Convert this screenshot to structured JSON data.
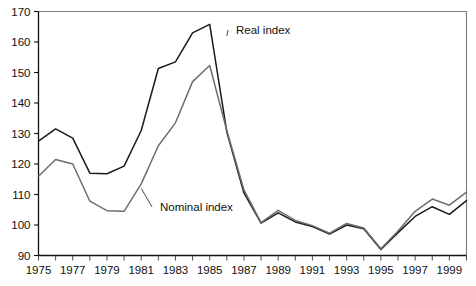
{
  "chart_data": {
    "type": "line",
    "title": "",
    "subtitle": "",
    "xlabel": "",
    "ylabel": "",
    "xlim": [
      1975,
      2000
    ],
    "ylim": [
      90,
      170
    ],
    "grid": false,
    "legend_position": "inline-annotations",
    "y_ticks": [
      90,
      100,
      110,
      120,
      130,
      140,
      150,
      160,
      170
    ],
    "y_tick_labels": [
      "90",
      "100",
      "110",
      "120",
      "130",
      "140",
      "150",
      "160",
      "170"
    ],
    "x_ticks": [
      1975,
      1976,
      1977,
      1978,
      1979,
      1980,
      1981,
      1982,
      1983,
      1984,
      1985,
      1986,
      1987,
      1988,
      1989,
      1990,
      1991,
      1992,
      1993,
      1994,
      1995,
      1996,
      1997,
      1998,
      1999,
      2000
    ],
    "x_tick_labels_shown": [
      "1975",
      "1977",
      "1979",
      "1981",
      "1983",
      "1985",
      "1987",
      "1989",
      "1991",
      "1993",
      "1995",
      "1997",
      "1999"
    ],
    "x": [
      1975,
      1976,
      1977,
      1978,
      1979,
      1980,
      1981,
      1982,
      1983,
      1984,
      1985,
      1986,
      1987,
      1988,
      1989,
      1990,
      1991,
      1992,
      1993,
      1994,
      1995,
      1996,
      1997,
      1998,
      1999,
      2000
    ],
    "series": [
      {
        "name": "Real index",
        "color": "#1a1a1a",
        "values": [
          127.5,
          131.5,
          128.5,
          117.0,
          116.8,
          119.3,
          131.0,
          151.3,
          153.5,
          163.0,
          165.8,
          130.5,
          110.5,
          100.6,
          104.0,
          101.0,
          99.5,
          97.0,
          100.0,
          98.8,
          92.0,
          97.5,
          102.8,
          106.0,
          103.5,
          108.0
        ]
      },
      {
        "name": "Nominal index",
        "color": "#6e6e6e",
        "values": [
          116.0,
          121.5,
          120.0,
          107.8,
          104.7,
          104.5,
          113.5,
          126.0,
          133.5,
          147.0,
          152.3,
          131.0,
          111.5,
          100.8,
          104.8,
          101.5,
          99.8,
          97.3,
          100.5,
          99.0,
          92.2,
          98.0,
          104.5,
          108.5,
          106.5,
          110.8
        ]
      }
    ],
    "annotations": [
      {
        "text": "Real index",
        "target_series": "Real index",
        "target_x": 1986,
        "target_y": 162
      },
      {
        "text": "Nominal index",
        "target_series": "Nominal index",
        "target_x": 1981,
        "target_y": 112
      }
    ]
  }
}
